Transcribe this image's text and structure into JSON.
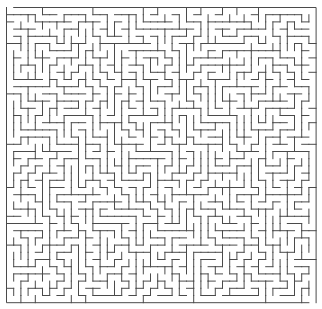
{
  "puzzle": {
    "title": "Maze",
    "type": "rectangular-maze",
    "columns": 43,
    "rows": 41,
    "origin": {
      "x": 6.5,
      "y": 7.5
    },
    "cell_size": {
      "w": 7.2,
      "h": 7.2
    },
    "seed": 48271,
    "colors": {
      "background": "#ffffff",
      "wall": "#4a4a4a"
    },
    "wall_width": 1
  }
}
